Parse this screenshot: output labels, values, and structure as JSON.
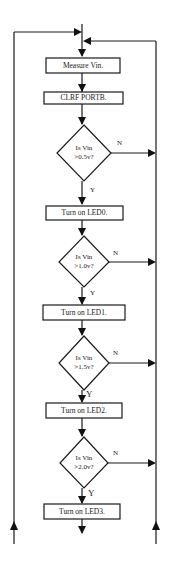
{
  "diagram": {
    "processes": [
      {
        "id": "measure",
        "label": "Measure Vin."
      },
      {
        "id": "clrf",
        "label": "CLRF PORTB."
      },
      {
        "id": "led0",
        "label": "Turn on LED0."
      },
      {
        "id": "led1",
        "label": "Turn on LED1."
      },
      {
        "id": "led2",
        "label": "Turn on LED2."
      },
      {
        "id": "led3",
        "label": "Turn on LED3."
      }
    ],
    "decisions": [
      {
        "id": "d1",
        "line1": "Is Vin",
        "line2": ">0.5v?",
        "yes": "Y",
        "no": "N"
      },
      {
        "id": "d2",
        "line1": "Is Vin",
        "line2": ">1.0v?",
        "yes": "Y",
        "no": "N"
      },
      {
        "id": "d3",
        "line1": "Is Vin",
        "line2": ">1.5v?",
        "yes": "Y",
        "no": "N"
      },
      {
        "id": "d4",
        "line1": "Is Vin",
        "line2": ">2.0v?",
        "yes": "Y",
        "no": "N"
      }
    ],
    "colors": {
      "line": "#1a1a1a",
      "background": "#ffffff",
      "text": "#222222"
    }
  }
}
